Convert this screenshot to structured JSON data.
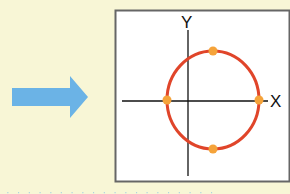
{
  "colors": {
    "background": "#f8f6d6",
    "arrow": "#6bb3e6",
    "panel_bg": "#ffffff",
    "panel_border": "#666666",
    "axis": "#111111",
    "circle": "#e0452a",
    "point": "#f5a33a",
    "caption": "#8fc3e6"
  },
  "diagram": {
    "arrow": {
      "direction": "right"
    },
    "panel": {
      "axes": {
        "x_label": "X",
        "y_label": "Y"
      },
      "shape": "circle",
      "points": [
        {
          "name": "left",
          "position": "negative x-intercept"
        },
        {
          "name": "right",
          "position": "positive x-intercept"
        },
        {
          "name": "top",
          "position": "top of circle"
        },
        {
          "name": "bottom",
          "position": "bottom of circle"
        }
      ]
    }
  },
  "caption": {
    "text": "· · · · · · · · · · · · · · · · · · · ·"
  }
}
